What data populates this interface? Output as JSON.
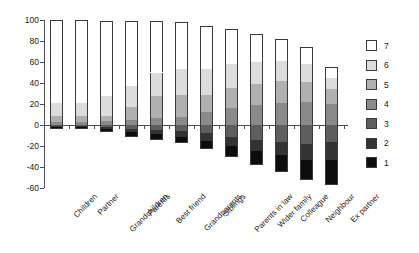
{
  "chart_data": {
    "type": "bar",
    "subtype": "diverging-stacked-bar",
    "title": "",
    "subtitle": "",
    "xlabel": "",
    "ylabel": "",
    "ylim": [
      -60,
      100
    ],
    "ytick_labels": [
      "100",
      "80",
      "60",
      "40",
      "20",
      "0",
      "-20",
      "-40",
      "-60"
    ],
    "ytick_values": [
      100,
      80,
      60,
      40,
      20,
      0,
      -20,
      -40,
      -60
    ],
    "grid": false,
    "legend_position": "right",
    "legend_title": "",
    "legend_entries": [
      {
        "label": "7",
        "color": "#ffffff"
      },
      {
        "label": "6",
        "color": "#dcdcdc"
      },
      {
        "label": "5",
        "color": "#b0b0b0"
      },
      {
        "label": "4",
        "color": "#8a8a8a"
      },
      {
        "label": "3",
        "color": "#5e5e5e"
      },
      {
        "label": "2",
        "color": "#333333"
      },
      {
        "label": "1",
        "color": "#0d0d0d"
      }
    ],
    "categories": [
      "Children",
      "Partner",
      "Grandchildren",
      "Parents",
      "Best friend",
      "Grandparents",
      "Siblings",
      "Parents in law",
      "Wider family",
      "Colleague",
      "Neighbour",
      "Ex partner"
    ],
    "series": [
      {
        "name": "7",
        "color": "#ffffff",
        "values": [
          79,
          79,
          71,
          62,
          49,
          45,
          41,
          33,
          27,
          21,
          16,
          10
        ]
      },
      {
        "name": "6",
        "color": "#dcdcdc",
        "values": [
          12,
          12,
          19,
          20,
          22,
          24,
          24,
          23,
          21,
          19,
          17,
          11
        ]
      },
      {
        "name": "5",
        "color": "#b0b0b0",
        "values": [
          6,
          6,
          5,
          12,
          21,
          21,
          17,
          19,
          20,
          21,
          19,
          14
        ]
      },
      {
        "name": "4",
        "color": "#8a8a8a",
        "values": [
          3,
          3,
          4,
          5,
          7,
          8,
          12,
          16,
          19,
          21,
          22,
          20
        ]
      },
      {
        "name": "3",
        "color": "#5e5e5e",
        "values": [
          -1,
          -1,
          -2,
          -4,
          -5,
          -6,
          -8,
          -11,
          -14,
          -16,
          -18,
          -16
        ]
      },
      {
        "name": "2",
        "color": "#333333",
        "values": [
          -1,
          -1,
          -2,
          -3,
          -4,
          -5,
          -7,
          -9,
          -11,
          -13,
          -15,
          -17
        ]
      },
      {
        "name": "1",
        "color": "#0d0d0d",
        "values": [
          -2,
          -2,
          -3,
          -4,
          -5,
          -6,
          -8,
          -10,
          -13,
          -16,
          -19,
          -24
        ]
      }
    ],
    "positive_totals": [
      97,
      97,
      95,
      94,
      95,
      92,
      88,
      81,
      74,
      68,
      58,
      35
    ],
    "negative_totals": [
      -3,
      -3,
      -6,
      -10,
      -12,
      -15,
      -21,
      -28,
      -36,
      -43,
      -50,
      -57
    ]
  }
}
